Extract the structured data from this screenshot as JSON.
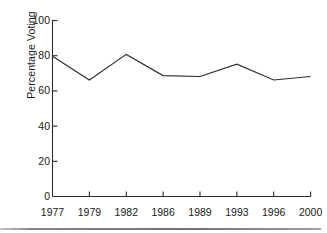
{
  "chart_data": {
    "type": "line",
    "title": "",
    "xlabel": "",
    "ylabel": "Percentage Voting",
    "categories": [
      "1977",
      "1979",
      "1982",
      "1986",
      "1989",
      "1993",
      "1996",
      "2000"
    ],
    "values": [
      79.5,
      66,
      80.5,
      68.5,
      68,
      75,
      66,
      68
    ],
    "series": [
      {
        "name": "Percentage Voting",
        "values": [
          79.5,
          66,
          80.5,
          68.5,
          68,
          75,
          66,
          68
        ]
      }
    ],
    "ylim": [
      0,
      100
    ],
    "yticks": [
      "0",
      "20",
      "40",
      "60",
      "80",
      "100"
    ],
    "ytick_values": [
      0,
      20,
      40,
      60,
      80,
      100
    ],
    "xticks": [
      "1977",
      "1979",
      "1982",
      "1986",
      "1989",
      "1993",
      "1996",
      "2000"
    ],
    "grid": false,
    "legend": "none",
    "line_color": "#2b2b2b",
    "axis_color": "#2b2b2b",
    "background_color": "#ffffff"
  },
  "axes": {
    "y_title": "Percentage Voting",
    "y_ticks": [
      {
        "label": "100",
        "value": 100
      },
      {
        "label": "80",
        "value": 80
      },
      {
        "label": "60",
        "value": 60
      },
      {
        "label": "40",
        "value": 40
      },
      {
        "label": "20",
        "value": 20
      },
      {
        "label": "0",
        "value": 0
      }
    ],
    "x_ticks": [
      {
        "label": "1977",
        "value": 79.5
      },
      {
        "label": "1979",
        "value": 66
      },
      {
        "label": "1982",
        "value": 80.5
      },
      {
        "label": "1986",
        "value": 68.5
      },
      {
        "label": "1989",
        "value": 68
      },
      {
        "label": "1993",
        "value": 75
      },
      {
        "label": "1996",
        "value": 66
      },
      {
        "label": "2000",
        "value": 68
      }
    ]
  }
}
